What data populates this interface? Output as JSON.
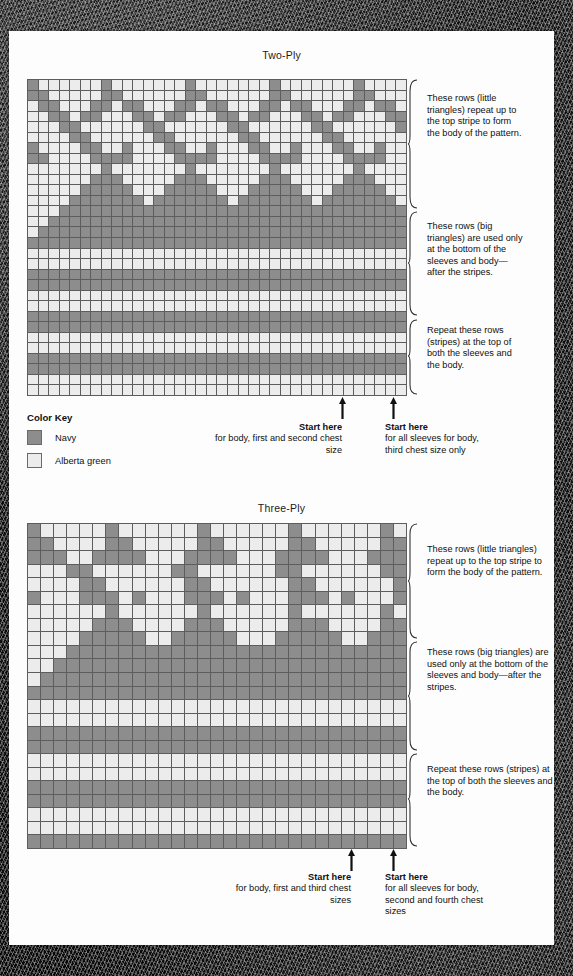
{
  "page": {
    "background_color": "#fdfdfd",
    "border_color": "#1a1a1a"
  },
  "palette": {
    "navy": "#8d8d8d",
    "alberta_green": "#ececec",
    "grid_line": "#5d5d5d"
  },
  "color_key": {
    "title": "Color Key",
    "items": [
      {
        "label": "Navy",
        "swatch": "navy"
      },
      {
        "label": "Alberta green",
        "swatch": "green"
      }
    ]
  },
  "charts": [
    {
      "id": "two-ply",
      "title": "Two-Ply",
      "columns": 36,
      "rows": 30,
      "notes": [
        {
          "id": "little-triangles",
          "text": "These rows (little triangles) repeat up to the top stripe to form the body of the pattern."
        },
        {
          "id": "big-triangles",
          "text": "These rows (big triangles) are used only at the bottom of the sleeves and body—after the stripes."
        },
        {
          "id": "stripes",
          "text": "Repeat these rows (stripes) at the top of both the sleeves and the body."
        }
      ],
      "start_markers": [
        {
          "id": "start-left",
          "title": "Start here",
          "detail": "for body, first and second chest size",
          "align": "right",
          "column": 30
        },
        {
          "id": "start-right",
          "title": "Start here",
          "detail": "for all sleeves for body, third chest size only",
          "align": "left",
          "column": 36
        }
      ],
      "chart_data": {
        "type": "heatmap",
        "title": "Two-Ply",
        "legend": [
          "Navy",
          "Alberta green"
        ],
        "xlabel": "",
        "ylabel": "",
        "grid": [
          "100000010000000100000001000000010000",
          "110000011000000110000001100000011000",
          "011000110110001101100011011000110110",
          "001101100011011000110110001101100011",
          "000110000001100000011000000110000001",
          "000011000000110000001100000011000000",
          "100001100100011001000110010001100100",
          "110000111100001111000011110000111100",
          "000000010000000100000001000000010000",
          "000000111000001110000011100000111000",
          "000001111100011111000111110001111100",
          "000011111110111111101111111011111110",
          "000111111111111111111111111111111111",
          "001111111111111111111111111111111111",
          "011111111111111111111111111111111111",
          "111111111111111111111111111111111111",
          "000000000000000000000000000000000000",
          "000000000000000000000000000000000000",
          "111111111111111111111111111111111111",
          "111111111111111111111111111111111111",
          "000000000000000000000000000000000000",
          "000000000000000000000000000000000000",
          "111111111111111111111111111111111111",
          "111111111111111111111111111111111111",
          "000000000000000000000000000000000000",
          "000000000000000000000000000000000000",
          "111111111111111111111111111111111111",
          "111111111111111111111111111111111111",
          "000000000000000000000000000000000000",
          "000000000000000000000000000000000000"
        ]
      }
    },
    {
      "id": "three-ply",
      "title": "Three-Ply",
      "columns": 29,
      "rows": 24,
      "notes": [
        {
          "id": "little-triangles",
          "text": "These rows (little triangles) repeat up to the top stripe to form the body of the pattern."
        },
        {
          "id": "big-triangles",
          "text": "These rows (big triangles) are used only at the bottom of the sleeves and body—after the stripes."
        },
        {
          "id": "stripes",
          "text": "Repeat these rows (stripes) at the top of both the sleeves and the body."
        }
      ],
      "start_markers": [
        {
          "id": "start-left",
          "title": "Start here",
          "detail": "for body, first and third chest sizes",
          "align": "right",
          "column": 23
        },
        {
          "id": "start-right",
          "title": "Start here",
          "detail": "for all sleeves for body, second and fourth chest sizes",
          "align": "left",
          "column": 29
        }
      ],
      "chart_data": {
        "type": "heatmap",
        "title": "Three-Ply",
        "legend": [
          "Navy",
          "Alberta green"
        ],
        "xlabel": "",
        "ylabel": "",
        "grid": [
          "10000010000001000000100000010",
          "11000011000001100000110000011",
          "11100111100011110001111000111",
          "00011000000110000001100000011",
          "00001100000011000000110000001",
          "10001110100011101000111010001",
          "00000010000001000000100000010",
          "00000111000011100000111000011",
          "00001111100111110001111100111",
          "00011111111111111111111111111",
          "00111111111111111111111111111",
          "01111111111111111111111111111",
          "11111111111111111111111111111",
          "00000000000000000000000000000",
          "00000000000000000000000000000",
          "11111111111111111111111111111",
          "11111111111111111111111111111",
          "00000000000000000000000000000",
          "00000000000000000000000000000",
          "11111111111111111111111111111",
          "11111111111111111111111111111",
          "00000000000000000000000000000",
          "00000000000000000000000000000",
          "11111111111111111111111111111"
        ]
      }
    }
  ]
}
